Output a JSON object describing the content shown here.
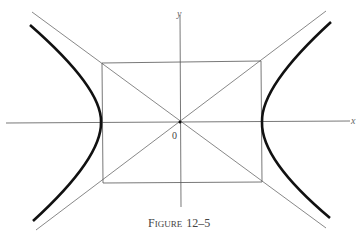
{
  "figure": {
    "caption_first": "F",
    "caption_rest": "IGURE",
    "caption_number": "12–5",
    "x_axis_label": "x",
    "y_axis_label": "y",
    "origin_label": "0"
  },
  "colors": {
    "curve": "#111111",
    "lines": "#555555",
    "background": "#ffffff"
  }
}
